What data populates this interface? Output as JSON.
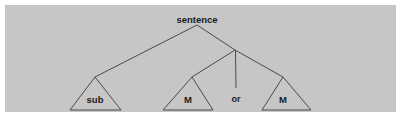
{
  "figure": {
    "type": "syntax-tree-diagram",
    "panel_color": "#c6c6c6",
    "page_color": "#ffffff",
    "line_color": "#4a4a4a",
    "text_color": "#1a1a1a"
  },
  "tree": {
    "root": {
      "label": "sentence",
      "x": 197,
      "y": 19
    },
    "junction": {
      "x": 235,
      "y": 50
    },
    "nodes": [
      {
        "id": "sub",
        "label": "sub",
        "shape": "triangle",
        "apex_x": 95,
        "apex_y": 77,
        "base_left_x": 70,
        "base_right_x": 121,
        "base_y": 110,
        "label_x": 95,
        "label_y": 99
      },
      {
        "id": "m1",
        "label": "M",
        "shape": "triangle",
        "apex_x": 192,
        "apex_y": 77,
        "base_left_x": 163,
        "base_right_x": 213,
        "base_y": 110,
        "label_x": 188,
        "label_y": 99
      },
      {
        "id": "or",
        "label": "or",
        "shape": "text",
        "label_x": 236,
        "label_y": 99
      },
      {
        "id": "m2",
        "label": "M",
        "shape": "triangle",
        "apex_x": 283,
        "apex_y": 77,
        "base_left_x": 262,
        "base_right_x": 311,
        "base_y": 110,
        "label_x": 283,
        "label_y": 99
      }
    ],
    "edges": [
      {
        "from": "root",
        "to": "sub",
        "x1": 197,
        "y1": 25,
        "x2": 95,
        "y2": 77
      },
      {
        "from": "root",
        "to": "junction",
        "x1": 197,
        "y1": 25,
        "x2": 235,
        "y2": 50
      },
      {
        "from": "junction",
        "to": "m1",
        "x1": 235,
        "y1": 50,
        "x2": 192,
        "y2": 77
      },
      {
        "from": "junction",
        "to": "or",
        "x1": 235,
        "y1": 50,
        "x2": 236,
        "y2": 88
      },
      {
        "from": "junction",
        "to": "m2",
        "x1": 235,
        "y1": 50,
        "x2": 283,
        "y2": 77
      }
    ]
  }
}
